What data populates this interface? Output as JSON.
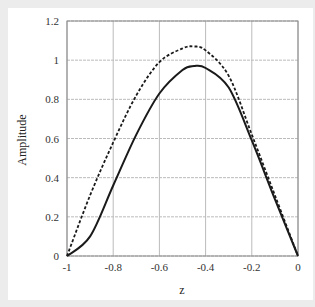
{
  "chart_data": {
    "type": "line",
    "title": "",
    "xlabel": "z",
    "ylabel": "Amplitude",
    "xlim": [
      -1,
      0
    ],
    "ylim": [
      0,
      1.2
    ],
    "grid": true,
    "legend": null,
    "x_ticks": [
      "-1",
      "-0.8",
      "-0.6",
      "-0.4",
      "-0.2",
      "0"
    ],
    "y_ticks": [
      "0",
      "0.2",
      "0.4",
      "0.6",
      "0.8",
      "1",
      "1.2"
    ],
    "x": [
      -1,
      -0.9,
      -0.8,
      -0.7,
      -0.6,
      -0.5,
      -0.45,
      -0.4,
      -0.3,
      -0.2,
      -0.1,
      0
    ],
    "series": [
      {
        "name": "dashed",
        "style": "dashed",
        "color": "#1a1a1a",
        "values": [
          0,
          0.31,
          0.58,
          0.82,
          0.99,
          1.06,
          1.07,
          1.05,
          0.92,
          0.62,
          0.31,
          0
        ]
      },
      {
        "name": "solid",
        "style": "solid",
        "color": "#1a1a1a",
        "values": [
          0,
          0.1,
          0.36,
          0.62,
          0.83,
          0.95,
          0.97,
          0.96,
          0.86,
          0.59,
          0.29,
          0
        ]
      }
    ]
  }
}
